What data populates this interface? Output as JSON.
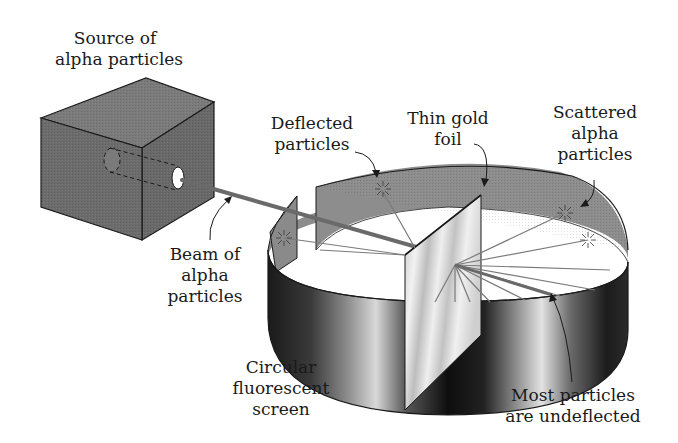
{
  "diagram": {
    "colors": {
      "box": "#6f6f6f",
      "box_top": "#7d7d7d",
      "box_side": "#666666",
      "screen_inner": "#8a8a8a",
      "beam": "#6a6a6a",
      "foil": "#d9d9d9",
      "outline": "#1a1a1a"
    }
  },
  "labels": {
    "source": {
      "line1": "Source of",
      "line2": "alpha particles"
    },
    "deflected": {
      "line1": "Deflected",
      "line2": "particles"
    },
    "foil": {
      "line1": "Thin gold",
      "line2": "foil"
    },
    "scattered": {
      "line1": "Scattered",
      "line2": "alpha",
      "line3": "particles"
    },
    "beam": {
      "line1": "Beam of",
      "line2": "alpha",
      "line3": "particles"
    },
    "screen": {
      "line1": "Circular",
      "line2": "fluorescent",
      "line3": "screen"
    },
    "undeflected": {
      "line1": "Most particles",
      "line2": "are undeflected"
    }
  }
}
